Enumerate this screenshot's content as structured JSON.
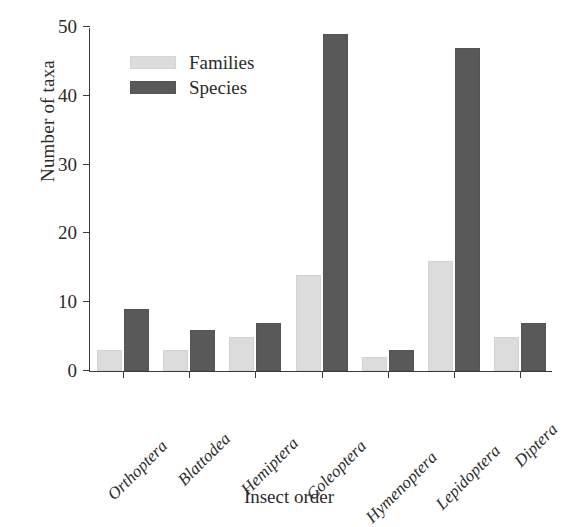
{
  "chart_data": {
    "type": "bar",
    "title": "",
    "xlabel": "Insect order",
    "ylabel": "Number of taxa",
    "categories": [
      "Orthoptera",
      "Blattodea",
      "Hemiptera",
      "Coleoptera",
      "Hymenoptera",
      "Lepidoptera",
      "Diptera"
    ],
    "series": [
      {
        "name": "Families",
        "color": "#dcdcdc",
        "values": [
          3,
          3,
          5,
          14,
          2,
          16,
          5
        ]
      },
      {
        "name": "Species",
        "color": "#595959",
        "values": [
          9,
          6,
          7,
          49,
          3,
          47,
          7
        ]
      }
    ],
    "ylim": [
      0,
      50
    ],
    "yticks": [
      0,
      10,
      20,
      30,
      40,
      50
    ],
    "ytick_labels": [
      "0",
      "10",
      "20",
      "30",
      "40",
      "50"
    ],
    "grid": false,
    "legend_position": "upper left",
    "legend_entries": [
      "Families",
      "Species"
    ]
  },
  "axes": {
    "y_title": "Number of taxa",
    "x_title": "Insect order"
  },
  "legend": {
    "families_label": "Families",
    "species_label": "Species"
  }
}
